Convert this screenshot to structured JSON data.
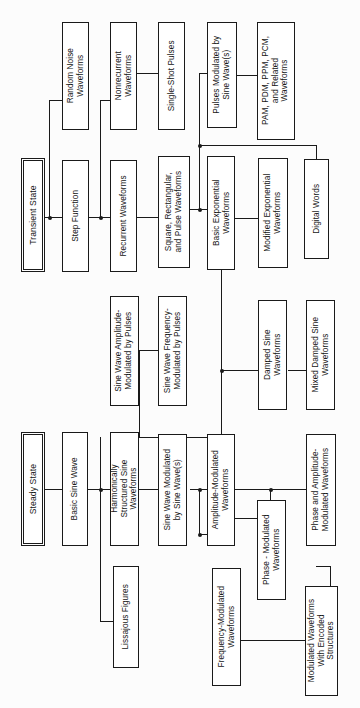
{
  "diagram": {
    "orientation": "rotated-90-ccw",
    "colors": {
      "line": "#1a1a1a",
      "box_fill": "#ffffff",
      "background": "#fcfcfc",
      "text": "#141414"
    },
    "roots": [
      {
        "id": "transient-state",
        "label": "Transient State"
      },
      {
        "id": "steady-state",
        "label": "Steady State"
      }
    ],
    "nodes": [
      {
        "id": "random-noise-waveforms",
        "label": "Random Noise\nWaveforms"
      },
      {
        "id": "step-function",
        "label": "Step Function"
      },
      {
        "id": "nonrecurrent-waveforms",
        "label": "Nonrecurrent\nWaveforms"
      },
      {
        "id": "recurrent-waveforms",
        "label": "Recurrent Waveforms"
      },
      {
        "id": "single-shot-pulses",
        "label": "Single-Shot Pulses"
      },
      {
        "id": "square-rectangular-pulse-waveforms",
        "label": "Square, Rectangular,\nand Pulse Waveforms"
      },
      {
        "id": "pulses-modulated-by-sine-waves",
        "label": "Pulses Modulated by\nSine Wave(s)"
      },
      {
        "id": "basic-exponential-waveforms",
        "label": "Basic Exponential\nWaveforms"
      },
      {
        "id": "pam-pdm-ppm-pcm-waveforms",
        "label": "PAM, PDM, PPM, PCM,\nand Related\nWaveforms"
      },
      {
        "id": "modified-exponential-waveforms",
        "label": "Modified Exponential\nWaveforms"
      },
      {
        "id": "digital-words",
        "label": "Digital Words"
      },
      {
        "id": "sine-wave-amplitude-modulated-by-pulses",
        "label": "Sine Wave Amplitude-\nModulated by Pulses"
      },
      {
        "id": "sine-wave-frequency-modulated-by-pulses",
        "label": "Sine Wave Frequency-\nModulated by Pulses"
      },
      {
        "id": "damped-sine-waveforms",
        "label": "Damped Sine\nWaveforms"
      },
      {
        "id": "mixed-damped-sine-waveforms",
        "label": "Mixed Damped Sine\nWaveforms"
      },
      {
        "id": "basic-sine-wave",
        "label": "Basic Sine Wave"
      },
      {
        "id": "harmonically-structured-sine-waveforms",
        "label": "Harmonically\nStructured Sine\nWaveforms"
      },
      {
        "id": "sine-wave-modulated-by-sine-waves",
        "label": "Sine Wave Modulated\nby Sine Wave(s)"
      },
      {
        "id": "amplitude-modulated-waveforms",
        "label": "Amplitude-Modulated\nWaveforms"
      },
      {
        "id": "lissajous-figures",
        "label": "Lissajous Figures"
      },
      {
        "id": "frequency-modulated-waveforms",
        "label": "Frequency-Modulated\nWaveforms"
      },
      {
        "id": "phase-modulated-waveforms",
        "label": "Phase - Modulated\nWaveforms"
      },
      {
        "id": "phase-and-amplitude-modulated-waveforms",
        "label": "Phase and Amplitude-\nModulated Waveforms"
      },
      {
        "id": "modulated-waveforms-with-encoded-structures",
        "label": "Modulated Waveforms\nWith Encoded\nStructures"
      }
    ]
  }
}
